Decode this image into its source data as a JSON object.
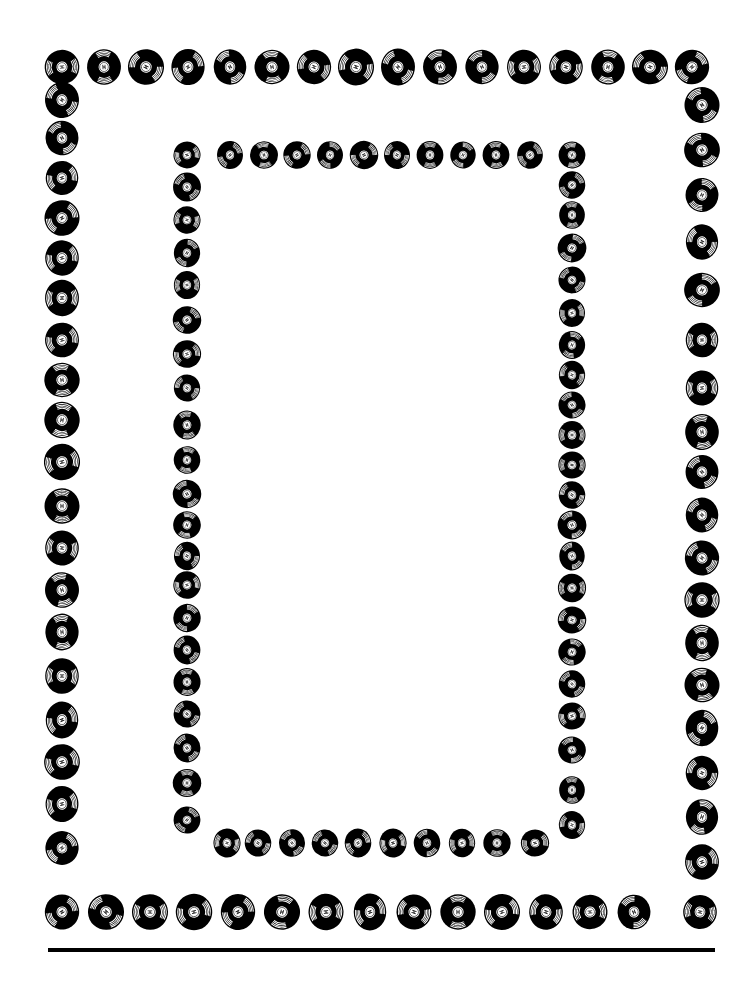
{
  "page": {
    "background": "#ffffff",
    "ink": "#000000",
    "width": 754,
    "height": 993
  },
  "outer_frame": {
    "record_size": 38,
    "top": {
      "y": 67,
      "x": [
        62,
        104,
        146,
        188,
        230,
        272,
        314,
        356,
        398,
        440,
        482,
        524,
        566,
        608,
        650,
        692
      ]
    },
    "left": {
      "x": 62,
      "y": [
        100,
        138,
        178,
        218,
        258,
        298,
        340,
        380,
        420,
        462,
        506,
        548,
        590,
        632,
        676,
        720,
        762,
        804,
        848
      ]
    },
    "right": {
      "x": 702,
      "y": [
        105,
        150,
        195,
        242,
        290,
        340,
        388,
        432,
        472,
        515,
        558,
        600,
        643,
        685,
        728,
        773,
        817,
        862
      ]
    },
    "bottom": {
      "y": 912,
      "x": [
        62,
        106,
        150,
        194,
        238,
        282,
        326,
        370,
        414,
        458,
        502,
        546,
        590,
        634,
        700
      ]
    }
  },
  "inner_frame": {
    "record_size": 30,
    "top": {
      "y": 155,
      "x": [
        187,
        230,
        264,
        297,
        330,
        364,
        397,
        430,
        463,
        496,
        530,
        572
      ]
    },
    "left": {
      "x": 187,
      "y": [
        187,
        220,
        253,
        285,
        320,
        354,
        388,
        425,
        460,
        494,
        525,
        556,
        585,
        618,
        650,
        682,
        714,
        748,
        783,
        820
      ]
    },
    "right": {
      "x": 572,
      "y": [
        185,
        215,
        248,
        280,
        313,
        345,
        375,
        405,
        435,
        465,
        495,
        525,
        556,
        588,
        620,
        652,
        684,
        716,
        750,
        790,
        825
      ]
    },
    "bottom": {
      "y": 843,
      "x": [
        227,
        258,
        292,
        325,
        358,
        393,
        427,
        462,
        497,
        535
      ]
    }
  },
  "rule": {
    "x1": 48,
    "x2": 715,
    "y": 950,
    "thickness": 4
  },
  "icons": {
    "record": "vinyl-record-icon"
  }
}
